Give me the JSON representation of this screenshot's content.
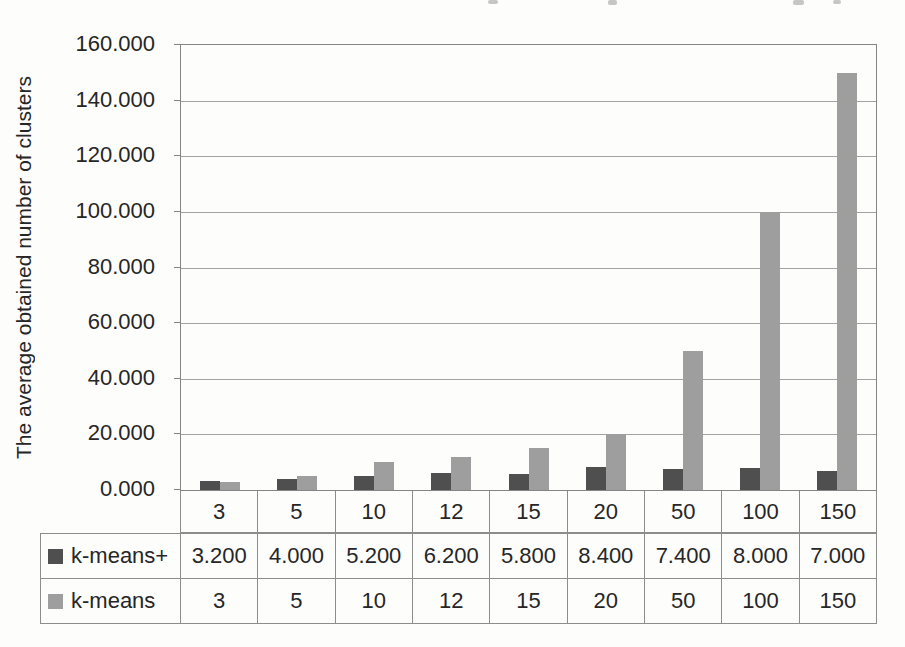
{
  "chart_data": {
    "type": "bar",
    "title": "",
    "xlabel": "",
    "ylabel": "The average obtained number of clusters",
    "ylim": [
      0,
      160
    ],
    "grid": true,
    "legend_position": "table-bottom-left",
    "yticks": [
      {
        "v": 160,
        "label": "160.000"
      },
      {
        "v": 140,
        "label": "140.000"
      },
      {
        "v": 120,
        "label": "120.000"
      },
      {
        "v": 100,
        "label": "100.000"
      },
      {
        "v": 80,
        "label": "80.000"
      },
      {
        "v": 60,
        "label": "60.000"
      },
      {
        "v": 40,
        "label": "40.000"
      },
      {
        "v": 20,
        "label": "20.000"
      },
      {
        "v": 0,
        "label": "0.000"
      }
    ],
    "categories": [
      "3",
      "5",
      "10",
      "12",
      "15",
      "20",
      "50",
      "100",
      "150"
    ],
    "series": [
      {
        "name": "k-means+",
        "color": "#4f4f4f",
        "values": [
          3.2,
          4.0,
          5.2,
          6.2,
          5.8,
          8.4,
          7.4,
          8.0,
          7.0
        ],
        "display": [
          "3.200",
          "4.000",
          "5.200",
          "6.200",
          "5.800",
          "8.400",
          "7.400",
          "8.000",
          "7.000"
        ]
      },
      {
        "name": "k-means",
        "color": "#9e9e9e",
        "values": [
          3,
          5,
          10,
          12,
          15,
          20,
          50,
          100,
          150
        ],
        "display": [
          "3",
          "5",
          "10",
          "12",
          "15",
          "20",
          "50",
          "100",
          "150"
        ]
      }
    ]
  }
}
